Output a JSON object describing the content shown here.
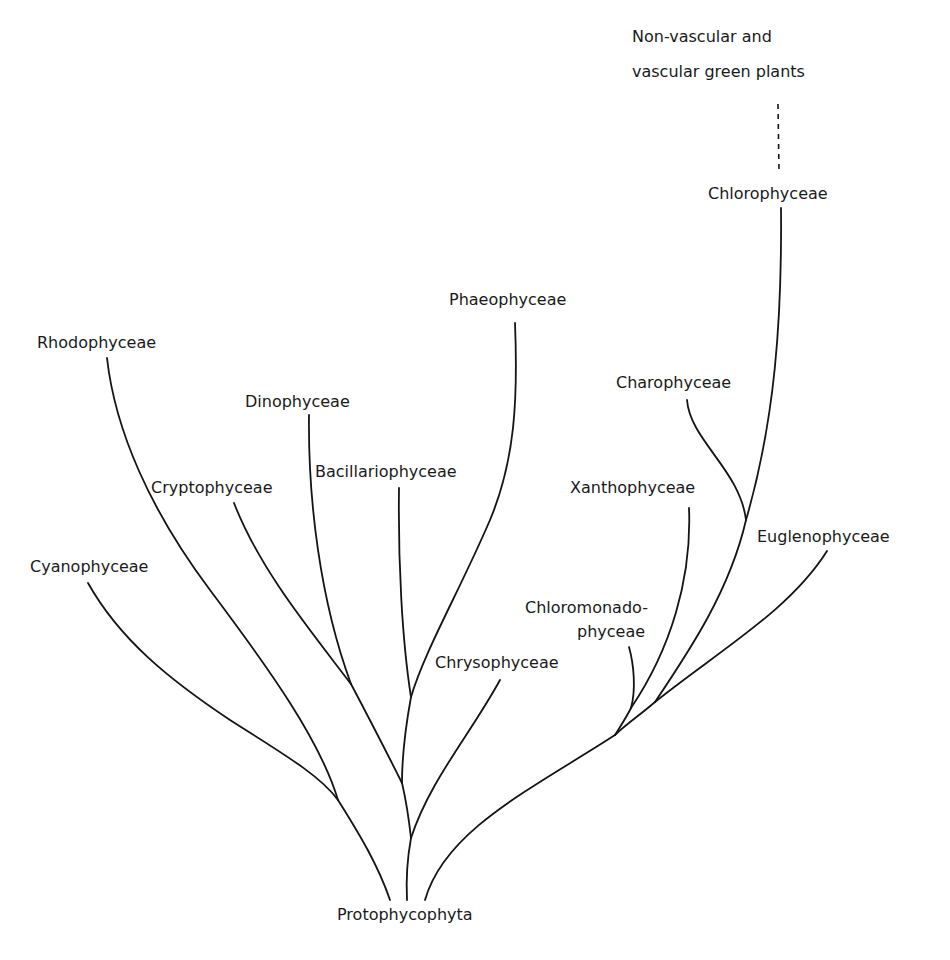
{
  "diagram": {
    "root": {
      "label": "Protophycophyta",
      "x": 337,
      "y": 920
    },
    "top_label": {
      "lines": [
        "Non-vascular and",
        "vascular green plants"
      ],
      "x": 632,
      "y": [
        42,
        77
      ]
    },
    "taxa": [
      {
        "id": "rhodophyceae",
        "label": "Rhodophyceae",
        "x": 37,
        "y": 348
      },
      {
        "id": "dinophyceae",
        "label": "Dinophyceae",
        "x": 245,
        "y": 407
      },
      {
        "id": "phaeophyceae",
        "label": "Phaeophyceae",
        "x": 449,
        "y": 305
      },
      {
        "id": "cryptophyceae",
        "label": "Cryptophyceae",
        "x": 151,
        "y": 493
      },
      {
        "id": "bacillariophyceae",
        "label": "Bacillariophyceae",
        "x": 315,
        "y": 477
      },
      {
        "id": "cyanophyceae",
        "label": "Cyanophyceae",
        "x": 30,
        "y": 572
      },
      {
        "id": "chrysophyceae",
        "label": "Chrysophyceae",
        "x": 435,
        "y": 668
      },
      {
        "id": "chlorophyceae",
        "label": "Chlorophyceae",
        "x": 708,
        "y": 199
      },
      {
        "id": "charophyceae",
        "label": "Charophyceae",
        "x": 616,
        "y": 388
      },
      {
        "id": "xanthophyceae",
        "label": "Xanthophyceae",
        "x": 570,
        "y": 493
      },
      {
        "id": "euglenophyceae",
        "label": "Euglenophyceae",
        "x": 757,
        "y": 542
      },
      {
        "id": "chloromonadophyceae_1",
        "label": "Chloromonado-",
        "x": 525,
        "y": 613
      },
      {
        "id": "chloromonadophyceae_2",
        "label": "phyceae",
        "x": 577,
        "y": 637
      }
    ],
    "branches": [
      {
        "id": "cyanophyceae-branch",
        "d": "M 88 583 C 120 640, 170 680, 230 720 C 280 752, 320 775, 338 800"
      },
      {
        "id": "rhodophyceae-branch",
        "d": "M 107 358 C 115 430, 150 510, 210 590 C 270 670, 320 740, 338 800"
      },
      {
        "id": "root-left-stem",
        "d": "M 338 800 C 360 835, 378 865, 390 900"
      },
      {
        "id": "cryptophyceae-branch",
        "d": "M 234 503 C 260 570, 310 630, 351 684"
      },
      {
        "id": "dinophyceae-branch",
        "d": "M 309 415 C 308 500, 320 600, 351 684"
      },
      {
        "id": "crypto-dino-stem",
        "d": "M 351 684 C 370 720, 388 755, 402 783"
      },
      {
        "id": "bacillariophyceae-branch",
        "d": "M 399 488 C 398 560, 402 640, 411 697"
      },
      {
        "id": "phaeophyceae-branch",
        "d": "M 515 323 C 518 400, 515 460, 490 520 C 460 590, 425 650, 411 697"
      },
      {
        "id": "bacillario-phaeo-stem",
        "d": "M 411 697 C 405 730, 402 760, 402 783"
      },
      {
        "id": "mid-stem-upper",
        "d": "M 402 783 C 406 800, 409 820, 411 838"
      },
      {
        "id": "chrysophyceae-branch",
        "d": "M 500 680 C 470 735, 430 780, 411 838"
      },
      {
        "id": "root-mid-stem",
        "d": "M 411 838 C 407 860, 406 880, 407 900"
      },
      {
        "id": "chlorophyceae-branch",
        "d": "M 781 208 C 782 320, 775 420, 746 520"
      },
      {
        "id": "charophyceae-branch",
        "d": "M 687 400 C 690 440, 740 470, 746 520"
      },
      {
        "id": "chloro-charo-stem",
        "d": "M 746 520 C 730 590, 690 650, 655 702"
      },
      {
        "id": "euglenophyceae-branch",
        "d": "M 827 551 C 790 610, 720 650, 655 702"
      },
      {
        "id": "euglena-chloro-stem",
        "d": "M 655 702 C 640 715, 625 725, 615 735"
      },
      {
        "id": "xanthophyceae-branch",
        "d": "M 689 508 C 692 580, 670 650, 631 708"
      },
      {
        "id": "chloromonadophyceae-branch",
        "d": "M 629 647 C 634 665, 636 690, 631 708"
      },
      {
        "id": "xantho-chloromonado-stem",
        "d": "M 631 708 C 626 718, 620 727, 615 735"
      },
      {
        "id": "root-right-stem",
        "d": "M 615 735 C 530 790, 445 830, 425 900"
      }
    ],
    "dashed_links": [
      {
        "id": "green-plants-link",
        "x1": 778,
        "y1": 104,
        "x2": 779,
        "y2": 172
      }
    ],
    "colors": {
      "line": "#141414",
      "text": "#1a1a1a",
      "background": "#ffffff"
    }
  }
}
